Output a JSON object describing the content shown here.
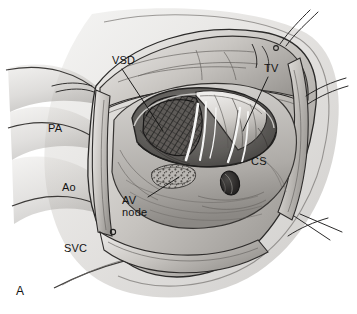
{
  "figure": {
    "panel_letter": "A",
    "modality": "surgical-anatomy-line-illustration",
    "view_description": "Right atriotomy exposure of the interior of the right atrium",
    "palette": {
      "background": "#ffffff",
      "tissue_light": "#d8d6d3",
      "tissue_mid": "#b3b0ac",
      "tissue_dark": "#8a8783",
      "shadow": "#4d4b49",
      "ink": "#1b1b1b",
      "label_text": "#131313",
      "defect_hatch": "#2e2c2b",
      "highlight_white": "#f7f7f6"
    }
  },
  "labels": [
    {
      "id": "vsd",
      "text": "VSD",
      "full_name": "ventricular septal defect",
      "x": 112,
      "y": 55,
      "leader": {
        "x1": 122,
        "y1": 69,
        "x2": 163,
        "y2": 131
      }
    },
    {
      "id": "tv",
      "text": "TV",
      "full_name": "tricuspid valve",
      "x": 264,
      "y": 63,
      "leader": {
        "x1": 268,
        "y1": 77,
        "x2": 243,
        "y2": 131
      }
    },
    {
      "id": "pa",
      "text": "PA",
      "full_name": "pulmonary artery",
      "x": 48,
      "y": 123,
      "leader": null
    },
    {
      "id": "ao",
      "text": "Ao",
      "full_name": "aorta",
      "x": 62,
      "y": 182,
      "leader": null
    },
    {
      "id": "svc",
      "text": "SVC",
      "full_name": "superior vena cava",
      "x": 64,
      "y": 243,
      "leader": null
    },
    {
      "id": "av-node",
      "text": "AV\nnode",
      "full_name": "atrioventricular node",
      "x": 122,
      "y": 195,
      "leader": {
        "x1": 148,
        "y1": 197,
        "x2": 179,
        "y2": 177
      }
    },
    {
      "id": "cs",
      "text": "CS",
      "full_name": "coronary sinus",
      "x": 251,
      "y": 156,
      "leader": null
    }
  ],
  "structures": [
    {
      "id": "vsd-opening",
      "name": "ventricular septal defect opening",
      "texture": "cross-hatched dark mesh"
    },
    {
      "id": "tricuspid-leaflets",
      "name": "tricuspid valve leaflets",
      "texture": "pale folded tissue"
    },
    {
      "id": "chordae",
      "name": "chordae tendineae",
      "texture": "bright white strands"
    },
    {
      "id": "av-node-patch",
      "name": "AV node region",
      "texture": "stippled oval patch"
    },
    {
      "id": "cs-ostium",
      "name": "coronary sinus ostium",
      "texture": "dark oval orifice"
    },
    {
      "id": "atriotomy-edge",
      "name": "retracted right atrial wall edge",
      "texture": "folded tissue margin"
    },
    {
      "id": "stay-sutures",
      "name": "retraction stay sutures",
      "texture": "fine radiating threads"
    }
  ]
}
